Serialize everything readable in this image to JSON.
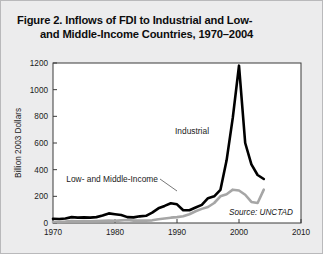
{
  "figure": {
    "title_line1": "Figure 2. Inflows of FDI to Industrial and Low-",
    "title_line2": "and Middle-Income Countries, 1970–2004",
    "source_note": "Source: UNCTAD",
    "background_color": "#ececed",
    "plot_background_color": "#ffffff",
    "frame_color": "#3a3a3a"
  },
  "annotations": {
    "industrial_label": "Industrial",
    "low_middle_label": "Low- and Middle-Income"
  },
  "chart_data": {
    "type": "line",
    "title": "Figure 2. Inflows of FDI to Industrial and Low- and Middle-Income Countries, 1970–2004",
    "xlabel": "",
    "ylabel": "Billion 2003 Dollars",
    "xlim": [
      1970,
      2010
    ],
    "ylim": [
      0,
      1200
    ],
    "xticks": [
      1970,
      1980,
      1990,
      2000,
      2010
    ],
    "yticks": [
      0,
      200,
      400,
      600,
      800,
      1000,
      1200
    ],
    "xtick_labels": [
      "1970",
      "1980",
      "1990",
      "2000",
      "2010"
    ],
    "ytick_labels": [
      "0",
      "200",
      "400",
      "600",
      "800",
      "1000",
      "1200"
    ],
    "grid": false,
    "legend_position": "inline-annotations",
    "x": [
      1970,
      1971,
      1972,
      1973,
      1974,
      1975,
      1976,
      1977,
      1978,
      1979,
      1980,
      1981,
      1982,
      1983,
      1984,
      1985,
      1986,
      1987,
      1988,
      1989,
      1990,
      1991,
      1992,
      1993,
      1994,
      1995,
      1996,
      1997,
      1998,
      1999,
      2000,
      2001,
      2002,
      2003,
      2004
    ],
    "series": [
      {
        "name": "Industrial",
        "color": "#000000",
        "line_width": 2.6,
        "values": [
          32,
          30,
          34,
          44,
          40,
          42,
          40,
          44,
          56,
          72,
          66,
          60,
          44,
          42,
          50,
          54,
          78,
          110,
          128,
          148,
          140,
          96,
          96,
          116,
          136,
          186,
          200,
          248,
          470,
          790,
          1180,
          600,
          440,
          360,
          330
        ]
      },
      {
        "name": "Low- and Middle-Income",
        "color": "#a6a6a6",
        "line_width": 2.6,
        "values": [
          8,
          8,
          10,
          14,
          12,
          14,
          12,
          14,
          16,
          18,
          16,
          20,
          22,
          18,
          18,
          18,
          20,
          28,
          34,
          40,
          44,
          50,
          66,
          88,
          106,
          120,
          150,
          200,
          216,
          250,
          244,
          212,
          158,
          150,
          250
        ]
      }
    ]
  }
}
